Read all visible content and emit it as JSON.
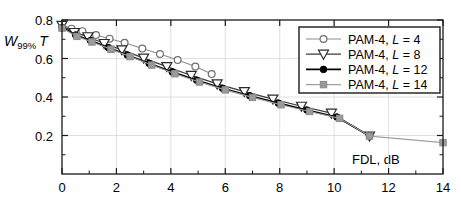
{
  "chart_data": {
    "type": "line",
    "title": "",
    "xlabel": "FDL, dB",
    "ylabel": "W99% T",
    "ylabel_parts": {
      "main": "W",
      "sub": "99%",
      "suffix": "T"
    },
    "xlim": [
      0,
      14
    ],
    "ylim": [
      0,
      0.8
    ],
    "xticks": [
      0,
      2,
      4,
      6,
      8,
      10,
      12,
      14
    ],
    "xticklabels": [
      "0",
      "2",
      "4",
      "6",
      "8",
      "10",
      "12",
      "14"
    ],
    "xminorticks": [
      1,
      3,
      5,
      7,
      9,
      11,
      13
    ],
    "yticks": [
      0.2,
      0.4,
      0.6,
      0.8
    ],
    "yticklabels": [
      "0.2",
      "0.4",
      "0.6",
      "0.8"
    ],
    "yminorticks": [
      0.1,
      0.3,
      0.5,
      0.7
    ],
    "grid": true,
    "legend_position": "upper-right",
    "series": [
      {
        "name": "PAM-4, L = 4",
        "label_prefix": "PAM-4, ",
        "label_italic": "L",
        "label_suffix": " = 4",
        "marker": "circle-open",
        "color": "#8c8c8c",
        "marker_edge_color": "#6e6e6e",
        "marker_fill": "#ffffff",
        "line_width": 1.1,
        "points": [
          [
            0.0,
            0.775
          ],
          [
            0.35,
            0.755
          ],
          [
            0.75,
            0.742
          ],
          [
            1.25,
            0.722
          ],
          [
            1.75,
            0.703
          ],
          [
            2.3,
            0.682
          ],
          [
            2.95,
            0.652
          ],
          [
            3.6,
            0.623
          ],
          [
            4.25,
            0.592
          ],
          [
            4.9,
            0.558
          ],
          [
            5.5,
            0.519
          ]
        ]
      },
      {
        "name": "PAM-4, L = 8",
        "label_prefix": "PAM-4, ",
        "label_italic": "L",
        "label_suffix": " = 8",
        "marker": "triangle-down-open",
        "color": "#3a3a3a",
        "marker_edge_color": "#2b2b2b",
        "marker_fill": "#ffffff",
        "line_width": 1.2,
        "points": [
          [
            0.0,
            0.772
          ],
          [
            0.45,
            0.735
          ],
          [
            0.95,
            0.713
          ],
          [
            1.55,
            0.678
          ],
          [
            2.2,
            0.645
          ],
          [
            3.0,
            0.602
          ],
          [
            3.85,
            0.558
          ],
          [
            4.75,
            0.512
          ],
          [
            5.7,
            0.468
          ],
          [
            6.7,
            0.428
          ],
          [
            7.75,
            0.389
          ],
          [
            8.8,
            0.352
          ],
          [
            9.9,
            0.316
          ],
          [
            11.3,
            0.197
          ]
        ]
      },
      {
        "name": "PAM-4, L = 12",
        "label_prefix": "PAM-4, ",
        "label_italic": "L",
        "label_suffix": " = 12",
        "marker": "circle-filled",
        "color": "#000000",
        "marker_edge_color": "#000000",
        "marker_fill": "#000000",
        "line_width": 1.8,
        "points": [
          [
            0.0,
            0.762
          ],
          [
            0.5,
            0.722
          ],
          [
            1.05,
            0.693
          ],
          [
            1.7,
            0.657
          ],
          [
            2.4,
            0.618
          ],
          [
            3.2,
            0.575
          ],
          [
            4.05,
            0.53
          ],
          [
            4.95,
            0.487
          ],
          [
            5.9,
            0.445
          ],
          [
            6.9,
            0.406
          ],
          [
            7.95,
            0.368
          ],
          [
            9.0,
            0.332
          ],
          [
            10.1,
            0.296
          ],
          [
            11.3,
            0.197
          ]
        ]
      },
      {
        "name": "PAM-4, L = 14",
        "label_prefix": "PAM-4, ",
        "label_italic": "L",
        "label_suffix": " = 14",
        "marker": "square-filled",
        "color": "#a0a0a0",
        "marker_edge_color": "#8a8a8a",
        "marker_fill": "#9a9a9a",
        "line_width": 1.1,
        "points": [
          [
            0.0,
            0.758
          ],
          [
            0.55,
            0.715
          ],
          [
            1.1,
            0.686
          ],
          [
            1.8,
            0.648
          ],
          [
            2.5,
            0.61
          ],
          [
            3.3,
            0.566
          ],
          [
            4.15,
            0.521
          ],
          [
            5.05,
            0.478
          ],
          [
            6.0,
            0.437
          ],
          [
            7.0,
            0.398
          ],
          [
            8.05,
            0.36
          ],
          [
            9.1,
            0.325
          ],
          [
            10.2,
            0.289
          ],
          [
            11.3,
            0.197
          ],
          [
            14.0,
            0.163
          ]
        ]
      }
    ]
  },
  "axes": {
    "frame_color": "#1a1a1a",
    "grid_color": "#d8d8d8"
  }
}
